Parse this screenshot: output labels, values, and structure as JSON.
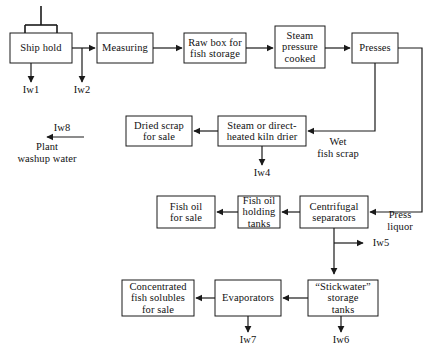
{
  "diagram": {
    "colors": {
      "line": "#1a1a1a",
      "box_fill": "#ffffff",
      "background": "#ffffff",
      "text": "#111111"
    },
    "nodes": [
      {
        "id": "ship-hold",
        "label": "Ship hold",
        "x": 10,
        "y": 33,
        "w": 62,
        "h": 30
      },
      {
        "id": "measuring",
        "label": "Measuring",
        "x": 97,
        "y": 33,
        "w": 56,
        "h": 30
      },
      {
        "id": "raw-box",
        "label": "Raw box for\nfish storage",
        "x": 184,
        "y": 33,
        "w": 62,
        "h": 30
      },
      {
        "id": "steam-pressure-cooked",
        "label": "Steam\npressure\ncooked",
        "x": 275,
        "y": 26,
        "w": 50,
        "h": 42
      },
      {
        "id": "presses",
        "label": "Presses",
        "x": 352,
        "y": 33,
        "w": 46,
        "h": 30
      },
      {
        "id": "kiln-drier",
        "label": "Steam or direct-\nheated kiln drier",
        "x": 218,
        "y": 116,
        "w": 88,
        "h": 30
      },
      {
        "id": "dried-scrap",
        "label": "Dried scrap\nfor sale",
        "x": 126,
        "y": 116,
        "w": 66,
        "h": 30
      },
      {
        "id": "centrifugal-separators",
        "label": "Centrifugal\nseparators",
        "x": 300,
        "y": 196,
        "w": 68,
        "h": 32
      },
      {
        "id": "fish-oil-holding-tanks",
        "label": "Fish oil\nholding\ntanks",
        "x": 238,
        "y": 196,
        "w": 42,
        "h": 32
      },
      {
        "id": "fish-oil-for-sale",
        "label": "Fish oil\nfor sale",
        "x": 157,
        "y": 196,
        "w": 58,
        "h": 32
      },
      {
        "id": "stickwater-tanks",
        "label": "“Stickwater”\nstorage\ntanks",
        "x": 308,
        "y": 280,
        "w": 70,
        "h": 36
      },
      {
        "id": "evaporators",
        "label": "Evaporators",
        "x": 215,
        "y": 280,
        "w": 66,
        "h": 36
      },
      {
        "id": "concentrated-solubles",
        "label": "Concentrated\nfish solubles\nfor sale",
        "x": 122,
        "y": 280,
        "w": 72,
        "h": 36
      }
    ],
    "edge_labels": [
      {
        "id": "wet-fish-scrap",
        "text": "Wet\nfish scrap",
        "x": 310,
        "y": 139
      },
      {
        "id": "press-liquor",
        "text": "Press\nliquor",
        "x": 381,
        "y": 209
      },
      {
        "id": "plant-washup",
        "text": "Plant\nwashup water",
        "x": 10,
        "y": 143
      }
    ],
    "waste_streams": [
      {
        "id": "iw1",
        "label": "Iw1",
        "x": 16,
        "y": 87
      },
      {
        "id": "iw2",
        "label": "Iw2",
        "x": 67,
        "y": 87
      },
      {
        "id": "iw4",
        "label": "Iw4",
        "x": 247,
        "y": 170
      },
      {
        "id": "iw5",
        "label": "Iw5",
        "x": 368,
        "y": 248
      },
      {
        "id": "iw6",
        "label": "Iw6",
        "x": 329,
        "y": 337
      },
      {
        "id": "iw7",
        "label": "Iw7",
        "x": 236,
        "y": 337
      },
      {
        "id": "iw8",
        "label": "Iw8",
        "x": 47,
        "y": 125
      }
    ]
  }
}
